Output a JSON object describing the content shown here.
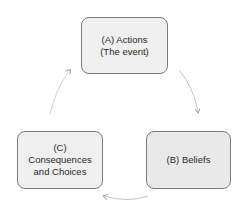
{
  "diagram": {
    "type": "cycle",
    "nodes": [
      {
        "id": "A",
        "label": "(A) Actions\n(The event)"
      },
      {
        "id": "B",
        "label": "(B) Beliefs"
      },
      {
        "id": "C",
        "label": "(C)\nConsequences\nand Choices"
      }
    ],
    "edges": [
      {
        "from": "A",
        "to": "B"
      },
      {
        "from": "B",
        "to": "C"
      },
      {
        "from": "C",
        "to": "A"
      }
    ],
    "colors": {
      "node_fill": "#efefef",
      "node_border": "#7a7a7a",
      "arrow": "#b8b8b8",
      "text": "#2a2a2a"
    }
  }
}
